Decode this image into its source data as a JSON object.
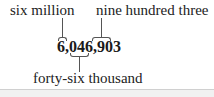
{
  "figure": {
    "number": "6,046,903",
    "labels": {
      "millions": "six million",
      "thousands": "forty-six thousand",
      "ones": "nine hundred three"
    }
  }
}
